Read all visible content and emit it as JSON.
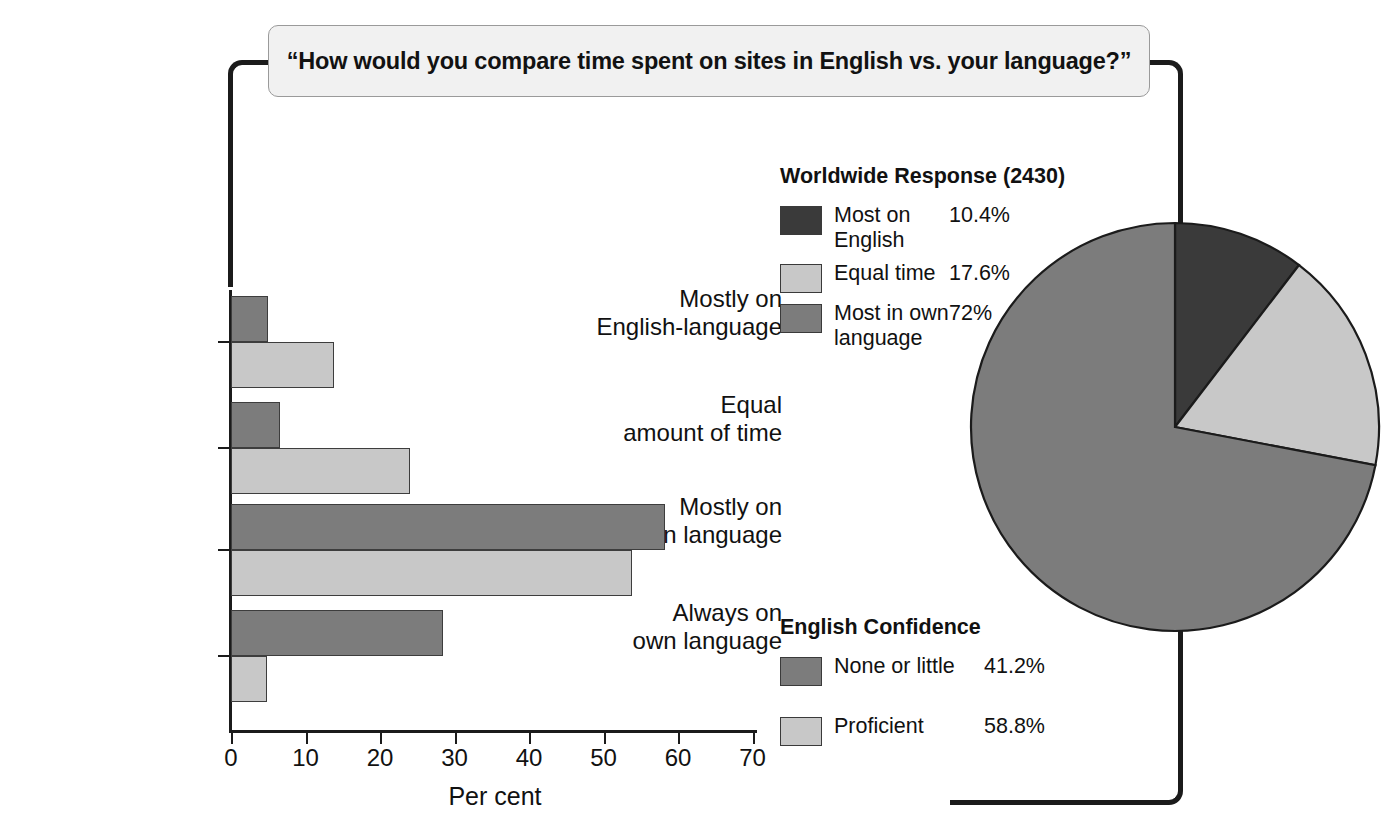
{
  "question": {
    "text": "“How  would you compare time spent on sites in English vs. your language?”"
  },
  "colors": {
    "dark": "#3a3a3a",
    "medium": "#7c7c7c",
    "light": "#c8c8c8",
    "outline": "#1b1b1b",
    "box_fill": "#f1f1f1"
  },
  "legend_worldwide": {
    "title": "Worldwide Response (2430)",
    "items": [
      {
        "label": "Most on English",
        "value": "10.4%",
        "swatch": "dark"
      },
      {
        "label": "Equal time",
        "value": "17.6%",
        "swatch": "light"
      },
      {
        "label": "Most in own language",
        "value": "72%",
        "swatch": "medium"
      }
    ]
  },
  "legend_confidence": {
    "title": "English Confidence",
    "items": [
      {
        "label": "None or little",
        "value": "41.2%",
        "swatch": "medium"
      },
      {
        "label": "Proficient",
        "value": "58.8%",
        "swatch": "light"
      }
    ]
  },
  "chart_data": [
    {
      "type": "bar",
      "orientation": "horizontal",
      "title": "",
      "xlabel": "Per cent",
      "ylabel": "",
      "xlim": [
        0,
        70
      ],
      "xticks": [
        0,
        10,
        20,
        30,
        40,
        50,
        60,
        70
      ],
      "xtick_labels": [
        "0",
        "10",
        "20",
        "30",
        "40",
        "50",
        "60",
        "70"
      ],
      "grid": false,
      "legend_position": "bottom-right",
      "categories": [
        "Mostly on English-language",
        "Equal amount of time",
        "Mostly on own language",
        "Always on own language"
      ],
      "category_lines": [
        [
          "Mostly on",
          "English-language"
        ],
        [
          "Equal",
          "amount of time"
        ],
        [
          "Mostly on",
          "own language"
        ],
        [
          "Always on",
          "own language"
        ]
      ],
      "series": [
        {
          "name": "None or little",
          "swatch": "medium",
          "values": [
            5.0,
            6.6,
            58.3,
            28.5
          ]
        },
        {
          "name": "Proficient",
          "swatch": "light",
          "values": [
            13.8,
            24.0,
            53.8,
            4.8
          ]
        }
      ]
    },
    {
      "type": "pie",
      "title": "Worldwide Response (2430)",
      "total_responses": 2430,
      "start_angle_deg": 0,
      "direction": "clockwise",
      "labels": [
        "Most on English",
        "Equal time",
        "Most in own language"
      ],
      "values": [
        10.4,
        17.6,
        72
      ],
      "value_labels": [
        "10.4%",
        "17.6%",
        "72%"
      ],
      "slice_swatches": [
        "dark",
        "light",
        "medium"
      ],
      "legend_position": "left"
    }
  ]
}
